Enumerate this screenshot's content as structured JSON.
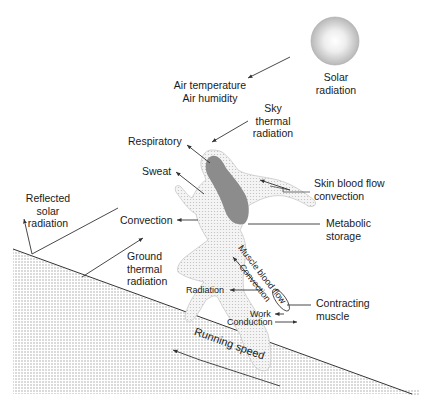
{
  "diagram": {
    "labels": {
      "solar_radiation": [
        "Solar",
        "radiation"
      ],
      "air": [
        "Air temperature",
        "Air humidity"
      ],
      "sky_thermal": [
        "Sky",
        "thermal",
        "radiation"
      ],
      "respiratory": "Respiratory",
      "sweat": "Sweat",
      "skin_blood_flow": [
        "Skin blood flow",
        "convection"
      ],
      "reflected_solar": [
        "Reflected",
        "solar",
        "radiation"
      ],
      "convection": "Convection",
      "metabolic_storage": [
        "Metabolic",
        "storage"
      ],
      "ground_thermal": [
        "Ground",
        "thermal",
        "radiation"
      ],
      "muscle_blood_flow": "Muscle blood flow",
      "muscle_convection": "Convection",
      "radiation": "Radiation",
      "contracting_muscle": [
        "Contracting",
        "muscle"
      ],
      "work": "Work",
      "conduction": "Conduction",
      "running_speed": "Running speed"
    },
    "colors": {
      "line": "#333333",
      "ground_dots": "#9a9a9a",
      "body_fill": "#e6e6e6",
      "core_fill": "#8c8c8c",
      "sun_outer": "#bdbdbd",
      "sun_inner": "#f2f2f2"
    }
  }
}
